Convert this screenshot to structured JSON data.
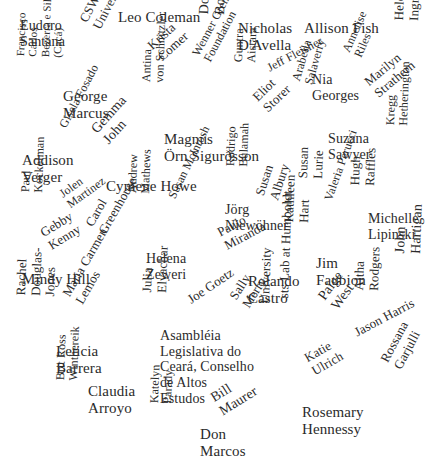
{
  "figure": {
    "type": "word-cloud",
    "title": "",
    "background_color": "#ffffff",
    "text_color": "#2b2b2b",
    "width": 434,
    "height": 469
  },
  "chart_data": {
    "type": "table",
    "title": "",
    "xlabel": "",
    "ylabel": "",
    "legend": [],
    "grid": false,
    "categories": [
      "Eudoro Santana",
      "CSWGS, Rice University",
      "Leo Coleman",
      "Dominic Boyer",
      "Nicholas D'Avella",
      "Allison Fish",
      "Helen Ingram",
      "Krista Comer",
      "Annelise Riles",
      "Jeff Fleisher",
      "Nia Georges",
      "Wenner Gren Foundation",
      "Guntra Aistara",
      "Francisco Carlos Bezerra e Silva (Cacá)",
      "George Marcus",
      "Antina von Schnitzler",
      "Arabella Salaverry",
      "Eliot Storer",
      "Marilyn Strathern",
      "Gisela Fosado",
      "Gemma John",
      "Magnús Örn Sigurðsson",
      "Suzana Sawyer",
      "Kregg Hetherington",
      "Addison Verger",
      "Cymene Howe",
      "Rodrigo Bulamah",
      "Susan Lurie",
      "Susan Albury",
      "Hugh Raffles",
      "Paul Kockelman",
      "Jolen Martinez",
      "Andrew Mathews",
      "Susan McIntosh",
      "Jörg Niewöhner",
      "Valeria Perucci",
      "Michelle Lipinski",
      "Gebby Kenny",
      "Carol Greenhouse",
      "Paulo Miranda",
      "Kathleen Hart",
      "Jim Faubion",
      "John Hartigan",
      "Mindy Hill",
      "Helena Zeweri",
      "Rolando Castro",
      "Paige West",
      "Altha Rodgers",
      "Douglas-Jones",
      "Rachel Douglas-Jones",
      "Maria Carmen Lemos",
      "Julia Elyachar",
      "Joe Goetz",
      "Sally Merry",
      "University",
      "sts Lab at Humboldt University",
      "Jason Harris",
      "Leticia Barrera",
      "Asambléia Legislativa do Ceará, Conselho de Altos Estudos",
      "Katie Ulrich",
      "Rossana Garjulli",
      "Claudia Arroyo",
      "Brit Ross Winthereik",
      "Bill Maurer",
      "Katelyn Parady",
      "Don Marcos",
      "Rosemary Hennessy"
    ],
    "values": [
      14,
      13,
      15,
      14,
      15,
      15,
      13,
      13,
      12,
      12,
      14,
      12,
      12,
      11,
      15,
      12,
      12,
      13,
      13,
      12,
      14,
      15,
      14,
      12,
      15,
      15,
      12,
      13,
      13,
      13,
      12,
      12,
      12,
      12,
      14,
      12,
      14,
      13,
      13,
      13,
      13,
      15,
      14,
      15,
      14,
      15,
      14,
      13,
      13,
      13,
      13,
      13,
      13,
      13,
      13,
      13,
      13,
      15,
      14,
      13,
      13,
      15,
      12,
      14,
      12,
      15,
      15
    ],
    "words": [
      {
        "text": "Eudoro\nSantana",
        "x": 20,
        "y": 18,
        "size": 14,
        "rotate": 0
      },
      {
        "text": "CSWGS, Rice\nUniversity",
        "x": 77,
        "y": 18,
        "size": 13,
        "rotate": -62
      },
      {
        "text": "Leo Coleman",
        "x": 118,
        "y": 9,
        "size": 15,
        "rotate": 0
      },
      {
        "text": "Dominic\nBoyer",
        "x": 196,
        "y": 14,
        "size": 14,
        "rotate": -88
      },
      {
        "text": "Nicholas\nD'Avella",
        "x": 238,
        "y": 20,
        "size": 15,
        "rotate": 0
      },
      {
        "text": "Allison Fish",
        "x": 304,
        "y": 20,
        "size": 15,
        "rotate": 0
      },
      {
        "text": "Helen\nIngram",
        "x": 392,
        "y": 20,
        "size": 13,
        "rotate": -88
      },
      {
        "text": "Krista\nComer",
        "x": 145,
        "y": 42,
        "size": 13,
        "rotate": -42
      },
      {
        "text": "Annelise\nRiles",
        "x": 340,
        "y": 49,
        "size": 12,
        "rotate": -66
      },
      {
        "text": "Jeff Fleisher",
        "x": 265,
        "y": 63,
        "size": 12,
        "rotate": -28
      },
      {
        "text": "Nia\nGeorges",
        "x": 312,
        "y": 72,
        "size": 14,
        "rotate": 0
      },
      {
        "text": "Wenner Gren\nFoundation",
        "x": 190,
        "y": 52,
        "size": 12,
        "rotate": -62
      },
      {
        "text": "Guntra\nAistara",
        "x": 232,
        "y": 62,
        "size": 12,
        "rotate": -88
      },
      {
        "text": "Francisco\nCarlos\nBezerra e Silva\n(Cacá)",
        "x": 14,
        "y": 56,
        "size": 11,
        "rotate": -88
      },
      {
        "text": "George\nMarcus",
        "x": 63,
        "y": 88,
        "size": 15,
        "rotate": 0
      },
      {
        "text": "Antina\nvon Schnitzler",
        "x": 140,
        "y": 82,
        "size": 12,
        "rotate": -88
      },
      {
        "text": "Arabella\nSalaverry",
        "x": 290,
        "y": 79,
        "size": 12,
        "rotate": -74
      },
      {
        "text": "Eliot\nStorer",
        "x": 250,
        "y": 94,
        "size": 13,
        "rotate": -44
      },
      {
        "text": "Marilyn\nStrathern",
        "x": 362,
        "y": 78,
        "size": 13,
        "rotate": -40
      },
      {
        "text": "Gisela Fosado",
        "x": 57,
        "y": 124,
        "size": 12,
        "rotate": -62
      },
      {
        "text": "Gemma\nJohn",
        "x": 88,
        "y": 126,
        "size": 14,
        "rotate": -48
      },
      {
        "text": "Magnús\nÖrn Sigurðsson",
        "x": 164,
        "y": 131,
        "size": 15,
        "rotate": 0
      },
      {
        "text": "Suzana\nSawyer",
        "x": 328,
        "y": 131,
        "size": 14,
        "rotate": 0
      },
      {
        "text": "Kregg\nHetherington",
        "x": 384,
        "y": 125,
        "size": 12,
        "rotate": -88
      },
      {
        "text": "Addison\nVerger",
        "x": 22,
        "y": 152,
        "size": 15,
        "rotate": 0
      },
      {
        "text": "Cymene Howe",
        "x": 106,
        "y": 178,
        "size": 15,
        "rotate": 0
      },
      {
        "text": "Rodrigo\nBulamah",
        "x": 224,
        "y": 166,
        "size": 12,
        "rotate": -88
      },
      {
        "text": "Susan\nLurie",
        "x": 296,
        "y": 178,
        "size": 13,
        "rotate": -88
      },
      {
        "text": "Susan\nAlbury",
        "x": 253,
        "y": 193,
        "size": 13,
        "rotate": -72
      },
      {
        "text": "Hugh\nRaffles",
        "x": 348,
        "y": 185,
        "size": 13,
        "rotate": -88
      },
      {
        "text": "Paul\nKockelman",
        "x": 19,
        "y": 192,
        "size": 12,
        "rotate": -88
      },
      {
        "text": "Jolen\nMartinez",
        "x": 57,
        "y": 190,
        "size": 12,
        "rotate": -36
      },
      {
        "text": "Andrew\nMathews",
        "x": 126,
        "y": 193,
        "size": 12,
        "rotate": -88
      },
      {
        "text": "Susan McIntosh",
        "x": 166,
        "y": 195,
        "size": 12,
        "rotate": -64
      },
      {
        "text": "Jörg\nNiewöhner",
        "x": 225,
        "y": 202,
        "size": 14,
        "rotate": 0
      },
      {
        "text": "Valeria Perucci",
        "x": 322,
        "y": 198,
        "size": 12,
        "rotate": -70
      },
      {
        "text": "Michelle\nLipinski",
        "x": 368,
        "y": 211,
        "size": 14,
        "rotate": 0
      },
      {
        "text": "Gebby\nKenny",
        "x": 38,
        "y": 228,
        "size": 13,
        "rotate": -32
      },
      {
        "text": "Carol\nGreenhouse",
        "x": 83,
        "y": 222,
        "size": 13,
        "rotate": -60
      },
      {
        "text": "Paulo\nMiranda",
        "x": 215,
        "y": 227,
        "size": 13,
        "rotate": -28
      },
      {
        "text": "Kathleen\nHart",
        "x": 282,
        "y": 222,
        "size": 13,
        "rotate": -88
      },
      {
        "text": "Jim\nFaubion",
        "x": 316,
        "y": 255,
        "size": 15,
        "rotate": 0
      },
      {
        "text": "John\nHartigan",
        "x": 392,
        "y": 253,
        "size": 14,
        "rotate": -88
      },
      {
        "text": "Mindy Hill",
        "x": 22,
        "y": 271,
        "size": 15,
        "rotate": 0
      },
      {
        "text": "Helena\nZeweri",
        "x": 146,
        "y": 251,
        "size": 14,
        "rotate": 0
      },
      {
        "text": "Rolando\nCastro",
        "x": 248,
        "y": 273,
        "size": 15,
        "rotate": 0
      },
      {
        "text": "Paige\nWest",
        "x": 315,
        "y": 294,
        "size": 14,
        "rotate": -54
      },
      {
        "text": "Altha\nRodgers",
        "x": 352,
        "y": 290,
        "size": 13,
        "rotate": -88
      },
      {
        "text": "Rachel\nDouglas-\nJones",
        "x": 14,
        "y": 295,
        "size": 13,
        "rotate": -88
      },
      {
        "text": "Maria Carmen\nLemos",
        "x": 60,
        "y": 292,
        "size": 13,
        "rotate": -60
      },
      {
        "text": "Julia\nElyachar",
        "x": 140,
        "y": 292,
        "size": 13,
        "rotate": -88
      },
      {
        "text": "Joe Goetz",
        "x": 185,
        "y": 295,
        "size": 13,
        "rotate": -34
      },
      {
        "text": "Sally\nMerry",
        "x": 227,
        "y": 295,
        "size": 13,
        "rotate": -58
      },
      {
        "text": "University",
        "x": 258,
        "y": 303,
        "size": 13,
        "rotate": -88
      },
      {
        "text": "sts Lab at Humboldt",
        "x": 277,
        "y": 298,
        "size": 13,
        "rotate": -88
      },
      {
        "text": "Jason Harris",
        "x": 352,
        "y": 327,
        "size": 13,
        "rotate": -28
      },
      {
        "text": "Leticia\nBarrera",
        "x": 56,
        "y": 343,
        "size": 15,
        "rotate": 0
      },
      {
        "text": "Asambléia\nLegislativa do\nCeará, Conselho\nde Altos\nEstudos",
        "x": 160,
        "y": 328,
        "size": 14,
        "rotate": 0
      },
      {
        "text": "Katie\nUlrich",
        "x": 302,
        "y": 353,
        "size": 13,
        "rotate": -30
      },
      {
        "text": "Rossana\nGarjulli",
        "x": 378,
        "y": 358,
        "size": 13,
        "rotate": -62
      },
      {
        "text": "Claudia\nArroyo",
        "x": 88,
        "y": 383,
        "size": 15,
        "rotate": 0
      },
      {
        "text": "Brit Ross\nWinthereik",
        "x": 54,
        "y": 380,
        "size": 12,
        "rotate": -88
      },
      {
        "text": "Bill\nMaurer",
        "x": 208,
        "y": 392,
        "size": 14,
        "rotate": -32
      },
      {
        "text": "Katelyn\nParady",
        "x": 148,
        "y": 403,
        "size": 12,
        "rotate": -88
      },
      {
        "text": "Don\nMarcos",
        "x": 200,
        "y": 426,
        "size": 15,
        "rotate": 0
      },
      {
        "text": "Rosemary\nHennessy",
        "x": 302,
        "y": 404,
        "size": 15,
        "rotate": 0
      }
    ]
  }
}
